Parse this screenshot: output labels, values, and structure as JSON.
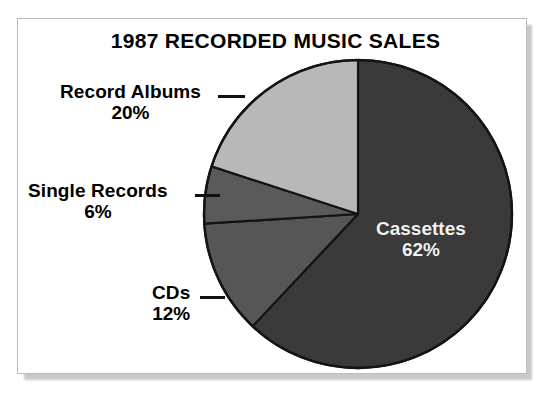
{
  "frame": {
    "border_color": "#bdbdbd",
    "background": "#ffffff"
  },
  "chart_data": {
    "type": "pie",
    "title": "1987 RECORDED MUSIC SALES",
    "xlabel": "",
    "ylabel": "",
    "unit": "%",
    "start_angle_deg": 0,
    "direction": "clockwise",
    "categories": [
      "Cassettes",
      "CDs",
      "Single Records",
      "Record Albums"
    ],
    "values": [
      62,
      12,
      6,
      20
    ],
    "labels": [
      "62%",
      "12%",
      "6%",
      "20%"
    ],
    "colors": [
      "#3a3a3a",
      "#565656",
      "#5a5a5a",
      "#b8b8b8"
    ],
    "label_placement": [
      "inside",
      "callout",
      "callout",
      "callout"
    ],
    "legend": "none",
    "grid": false,
    "slices": [
      {
        "name": "Cassettes",
        "value": 62,
        "label": "Cassettes",
        "percent_label": "62%",
        "color": "#3a3a3a",
        "start_deg": 0,
        "end_deg": 223.2,
        "label_placement": "inside",
        "label_color": "#f2f2f2"
      },
      {
        "name": "CDs",
        "value": 12,
        "label": "CDs",
        "percent_label": "12%",
        "color": "#565656",
        "start_deg": 223.2,
        "end_deg": 266.4,
        "label_placement": "callout",
        "label_color": "#000000"
      },
      {
        "name": "Single Records",
        "value": 6,
        "label": "Single Records",
        "percent_label": "6%",
        "color": "#5a5a5a",
        "start_deg": 266.4,
        "end_deg": 288.0,
        "label_placement": "callout",
        "label_color": "#000000"
      },
      {
        "name": "Record Albums",
        "value": 20,
        "label": "Record Albums",
        "percent_label": "20%",
        "color": "#b8b8b8",
        "start_deg": 288.0,
        "end_deg": 360.0,
        "label_placement": "callout",
        "label_color": "#000000"
      }
    ]
  }
}
